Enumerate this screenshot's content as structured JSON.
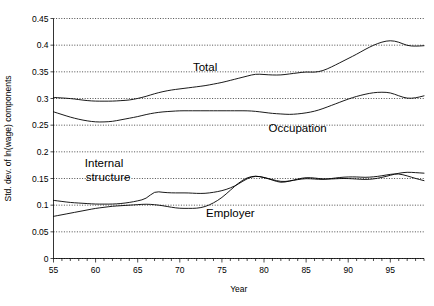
{
  "chart_data": {
    "type": "line",
    "title": "",
    "xlabel": "Year",
    "ylabel": "Std. dev. of ln(wage) components",
    "xlim": [
      55,
      99
    ],
    "ylim": [
      0,
      0.45
    ],
    "grid": true,
    "legend_position": "inline-annotations",
    "y_ticks": [
      "0",
      "0.05",
      "0.1",
      "0.15",
      "0.2",
      "0.25",
      "0.3",
      "0.35",
      "0.4",
      "0.45"
    ],
    "y_tick_values": [
      0,
      0.05,
      0.1,
      0.15,
      0.2,
      0.25,
      0.3,
      0.35,
      0.4,
      0.45
    ],
    "x_ticks": [
      "55",
      "60",
      "65",
      "70",
      "75",
      "80",
      "85",
      "90",
      "95"
    ],
    "x_tick_values": [
      55,
      60,
      65,
      70,
      75,
      80,
      85,
      90,
      95
    ],
    "x": [
      55,
      56,
      57,
      58,
      59,
      60,
      61,
      62,
      63,
      64,
      65,
      66,
      67,
      68,
      69,
      70,
      71,
      72,
      73,
      74,
      75,
      76,
      77,
      78,
      79,
      80,
      81,
      82,
      83,
      84,
      85,
      86,
      87,
      88,
      89,
      90,
      91,
      92,
      93,
      94,
      95,
      96,
      97,
      98,
      99
    ],
    "series": [
      {
        "name": "Total",
        "label": "Total",
        "label_x": 73,
        "label_y": 0.352,
        "values": [
          0.302,
          0.301,
          0.3,
          0.298,
          0.296,
          0.295,
          0.295,
          0.295,
          0.296,
          0.297,
          0.3,
          0.304,
          0.309,
          0.313,
          0.316,
          0.318,
          0.32,
          0.322,
          0.324,
          0.327,
          0.33,
          0.334,
          0.338,
          0.342,
          0.346,
          0.345,
          0.344,
          0.344,
          0.346,
          0.348,
          0.35,
          0.349,
          0.352,
          0.359,
          0.367,
          0.375,
          0.383,
          0.392,
          0.4,
          0.406,
          0.409,
          0.406,
          0.399,
          0.398,
          0.399
        ]
      },
      {
        "name": "Occupation",
        "label": "Occupation",
        "label_x": 84,
        "label_y": 0.238,
        "values": [
          0.275,
          0.27,
          0.265,
          0.261,
          0.258,
          0.256,
          0.256,
          0.257,
          0.26,
          0.263,
          0.266,
          0.27,
          0.273,
          0.275,
          0.276,
          0.277,
          0.277,
          0.277,
          0.277,
          0.277,
          0.277,
          0.277,
          0.277,
          0.277,
          0.276,
          0.274,
          0.272,
          0.271,
          0.27,
          0.271,
          0.273,
          0.276,
          0.281,
          0.287,
          0.293,
          0.299,
          0.304,
          0.308,
          0.311,
          0.312,
          0.311,
          0.305,
          0.3,
          0.301,
          0.305
        ]
      },
      {
        "name": "Internal structure",
        "label": "Internal",
        "label2": "structure",
        "label_x": 61,
        "label_y": 0.172,
        "values": [
          0.109,
          0.107,
          0.105,
          0.104,
          0.103,
          0.102,
          0.102,
          0.102,
          0.103,
          0.105,
          0.108,
          0.112,
          0.126,
          0.124,
          0.123,
          0.123,
          0.123,
          0.122,
          0.122,
          0.124,
          0.127,
          0.132,
          0.14,
          0.15,
          0.155,
          0.152,
          0.148,
          0.144,
          0.145,
          0.148,
          0.15,
          0.149,
          0.148,
          0.15,
          0.152,
          0.153,
          0.153,
          0.152,
          0.153,
          0.155,
          0.158,
          0.159,
          0.155,
          0.15,
          0.146
        ]
      },
      {
        "name": "Employer",
        "label": "Employer",
        "label_x": 76,
        "label_y": 0.078,
        "values": [
          0.079,
          0.082,
          0.085,
          0.088,
          0.091,
          0.094,
          0.096,
          0.098,
          0.099,
          0.1,
          0.101,
          0.102,
          0.101,
          0.099,
          0.096,
          0.094,
          0.094,
          0.094,
          0.097,
          0.104,
          0.114,
          0.128,
          0.142,
          0.152,
          0.155,
          0.152,
          0.147,
          0.142,
          0.145,
          0.149,
          0.152,
          0.151,
          0.149,
          0.149,
          0.15,
          0.15,
          0.149,
          0.148,
          0.149,
          0.152,
          0.156,
          0.16,
          0.162,
          0.161,
          0.16
        ]
      }
    ]
  }
}
